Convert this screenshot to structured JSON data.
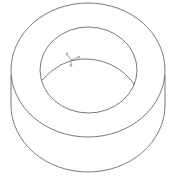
{
  "viewport": {
    "title": "Ring part isometric view"
  },
  "drawing": {
    "type": "ring-washer-wireframe",
    "line_color": "#6a6a6a",
    "background": "#ffffff",
    "outer_top_ellipse": {
      "cx": 88,
      "cy": 70,
      "rx": 77,
      "ry": 67
    },
    "inner_top_ellipse": {
      "cx": 88.5,
      "cy": 70,
      "rx": 48.5,
      "ry": 43
    },
    "outer_bottom_arc_bottom_y": 172,
    "side_edge_left_x": 11,
    "side_edge_right_x": 165,
    "bore_bottom_arc": {
      "start": [
        42,
        80
      ],
      "peak": [
        80,
        59
      ],
      "end": [
        135,
        85
      ]
    }
  },
  "triad": {
    "label": "coordinate-axis-triad",
    "origin": [
      71,
      62
    ]
  }
}
